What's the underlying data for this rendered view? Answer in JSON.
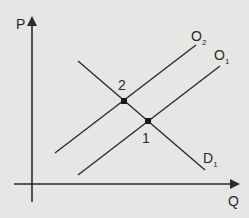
{
  "diagram": {
    "type": "supply-demand",
    "axes": {
      "y_label": "P",
      "x_label": "Q"
    },
    "curves": [
      {
        "id": "D1",
        "label": "D",
        "subscript": "1",
        "kind": "demand"
      },
      {
        "id": "O1",
        "label": "O",
        "subscript": "1",
        "kind": "supply"
      },
      {
        "id": "O2",
        "label": "O",
        "subscript": "2",
        "kind": "supply"
      }
    ],
    "points": [
      {
        "id": "1",
        "label": "1",
        "description": "D1 ∩ O1"
      },
      {
        "id": "2",
        "label": "2",
        "description": "D1 ∩ O2"
      }
    ],
    "colors": {
      "background": "#e6e6e4",
      "line": "#2b2b2b"
    }
  }
}
